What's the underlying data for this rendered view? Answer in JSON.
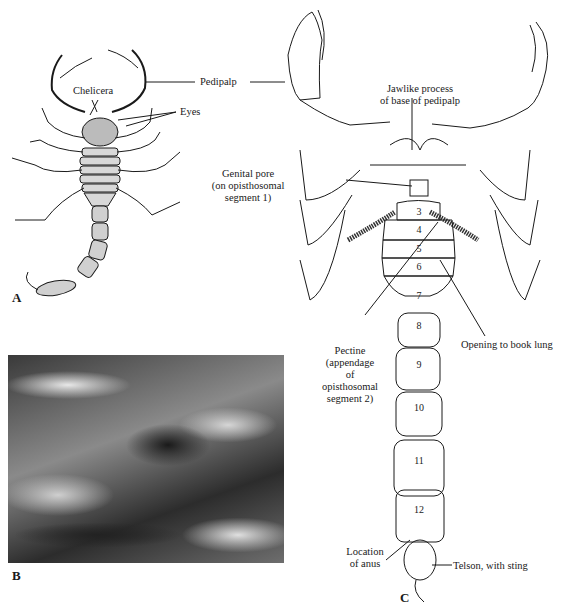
{
  "figure": {
    "panels": [
      {
        "letter": "A",
        "kind": "drawing",
        "description": "Dorsal view of scorpion"
      },
      {
        "letter": "B",
        "kind": "photograph",
        "description": "Live scorpion on bark"
      },
      {
        "letter": "C",
        "kind": "labeled-diagram",
        "description": "Ventral view of scorpion"
      }
    ],
    "panel_a_labels": {
      "chelicera": "Chelicera",
      "eyes": "Eyes",
      "pedipalp": "Pedipalp"
    },
    "panel_c_labels": {
      "jawlike_line1": "Jawlike process",
      "jawlike_line2": "of base of pedipalp",
      "genital_line1": "Genital pore",
      "genital_line2": "(on opisthosomal",
      "genital_line3": "segment 1)",
      "pectine_line1": "Pectine",
      "pectine_line2": "(appendage",
      "pectine_line3": "of",
      "pectine_line4": "opisthosomal",
      "pectine_line5": "segment 2)",
      "book_lung": "Opening to book lung",
      "anus_line1": "Location",
      "anus_line2": "of anus",
      "telson": "Telson, with sting"
    },
    "segments": [
      "3",
      "4",
      "5",
      "6",
      "7",
      "8",
      "9",
      "10",
      "11",
      "12"
    ],
    "colors": {
      "ink": "#1a1a1a",
      "background": "#ffffff"
    }
  }
}
